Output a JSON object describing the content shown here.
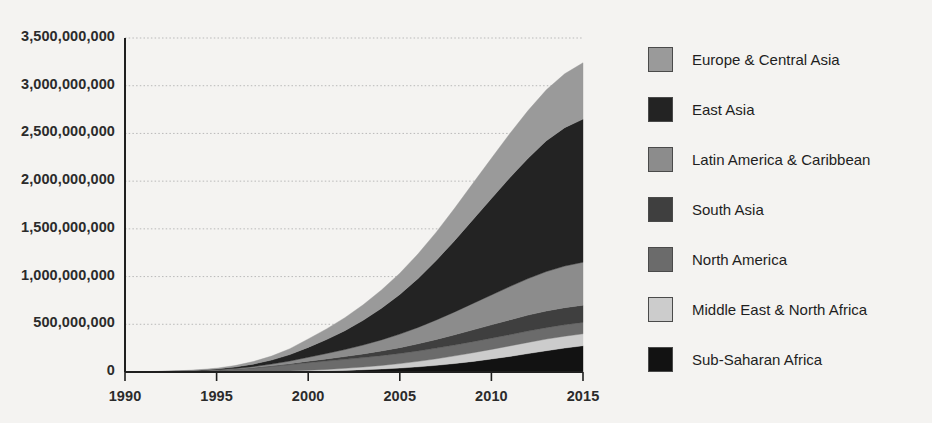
{
  "chart_data": {
    "type": "area",
    "stacked": true,
    "title": "",
    "xlabel": "",
    "ylabel": "",
    "x": [
      1990,
      1991,
      1992,
      1993,
      1994,
      1995,
      1996,
      1997,
      1998,
      1999,
      2000,
      2001,
      2002,
      2003,
      2004,
      2005,
      2006,
      2007,
      2008,
      2009,
      2010,
      2011,
      2012,
      2013,
      2014,
      2015
    ],
    "xlim": [
      1990,
      2015
    ],
    "ylim": [
      0,
      3500000000
    ],
    "xticks": [
      1990,
      1995,
      2000,
      2005,
      2010,
      2015
    ],
    "xtick_labels": [
      "1990",
      "1995",
      "2000",
      "2005",
      "2010",
      "2015"
    ],
    "yticks": [
      0,
      500000000,
      1000000000,
      1500000000,
      2000000000,
      2500000000,
      3000000000,
      3500000000
    ],
    "ytick_labels": [
      "0",
      "500,000,000",
      "1,000,000,000",
      "1,500,000,000",
      "2,000,000,000",
      "2,500,000,000",
      "3,000,000,000",
      "3,500,000,000"
    ],
    "grid": true,
    "grid_axis": "y",
    "grid_style": "dotted",
    "legend_position": "right",
    "stack_order_bottom_to_top": [
      "Sub-Saharan Africa",
      "Middle East & North Africa",
      "North America",
      "South Asia",
      "Latin America & Caribbean",
      "East Asia",
      "Europe & Central Asia"
    ],
    "series": [
      {
        "name": "Europe & Central Asia",
        "color": "#9a9a9a",
        "values": [
          400000,
          900000,
          1700000,
          3000000,
          5200000,
          9000000,
          16000000,
          27000000,
          42000000,
          62000000,
          88000000,
          112000000,
          137000000,
          163000000,
          192000000,
          223000000,
          258000000,
          297000000,
          339000000,
          381000000,
          422000000,
          462000000,
          500000000,
          535000000,
          565000000,
          590000000
        ]
      },
      {
        "name": "East Asia",
        "color": "#232323",
        "values": [
          300000,
          700000,
          1400000,
          2600000,
          4800000,
          8500000,
          15000000,
          26000000,
          42000000,
          67000000,
          104000000,
          146000000,
          197000000,
          259000000,
          331000000,
          415000000,
          513000000,
          625000000,
          749000000,
          880000000,
          1010000000,
          1140000000,
          1260000000,
          1370000000,
          1450000000,
          1500000000
        ]
      },
      {
        "name": "Latin America & Caribbean",
        "color": "#8c8c8c",
        "values": [
          120000,
          280000,
          550000,
          1000000,
          1900000,
          3400000,
          6000000,
          10500000,
          17500000,
          27500000,
          41000000,
          56000000,
          73000000,
          93000000,
          116000000,
          142000000,
          172000000,
          205000000,
          240000000,
          277000000,
          313000000,
          349000000,
          383000000,
          413000000,
          436000000,
          450000000
        ]
      },
      {
        "name": "South Asia",
        "color": "#3f3f3f",
        "values": [
          40000,
          90000,
          180000,
          340000,
          640000,
          1150000,
          2100000,
          3700000,
          6200000,
          10000000,
          15500000,
          22000000,
          29500000,
          38500000,
          49000000,
          61000000,
          75000000,
          90500000,
          107000000,
          124000000,
          140000000,
          155000000,
          167000000,
          175000000,
          179000000,
          180000000
        ]
      },
      {
        "name": "North America",
        "color": "#6b6b6b",
        "values": [
          900000,
          1900000,
          3500000,
          6200000,
          10500000,
          17000000,
          26000000,
          38000000,
          52000000,
          66000000,
          79000000,
          88000000,
          94000000,
          99000000,
          103000000,
          106000000,
          109000000,
          112000000,
          114000000,
          116000000,
          117000000,
          118000000,
          119000000,
          119500000,
          120000000,
          120000000
        ]
      },
      {
        "name": "Middle East & North Africa",
        "color": "#cccccc",
        "values": [
          20000,
          50000,
          100000,
          200000,
          400000,
          750000,
          1400000,
          2500000,
          4300000,
          7000000,
          11000000,
          16000000,
          22000000,
          29000000,
          37500000,
          47000000,
          57500000,
          68500000,
          80000000,
          91000000,
          101000000,
          110000000,
          117000000,
          122000000,
          124000000,
          125000000
        ]
      },
      {
        "name": "Sub-Saharan Africa",
        "color": "#121212",
        "values": [
          10000,
          25000,
          55000,
          110000,
          220000,
          420000,
          800000,
          1500000,
          2700000,
          4600000,
          7500000,
          11500000,
          16500000,
          23000000,
          31000000,
          41000000,
          54000000,
          70000000,
          89000000,
          111000000,
          136000000,
          163000000,
          193000000,
          223000000,
          251000000,
          275000000
        ]
      }
    ]
  },
  "legend": {
    "items": [
      {
        "label": "Europe & Central Asia",
        "color": "#9a9a9a"
      },
      {
        "label": "East Asia",
        "color": "#232323"
      },
      {
        "label": "Latin America & Caribbean",
        "color": "#8c8c8c"
      },
      {
        "label": "South Asia",
        "color": "#3f3f3f"
      },
      {
        "label": "North America",
        "color": "#6b6b6b"
      },
      {
        "label": "Middle East & North Africa",
        "color": "#cccccc"
      },
      {
        "label": "Sub-Saharan Africa",
        "color": "#121212"
      }
    ]
  },
  "axes": {
    "axis_color": "#1f1f1f",
    "grid_color": "#b9b9b9",
    "background": "#f4f3f1"
  }
}
